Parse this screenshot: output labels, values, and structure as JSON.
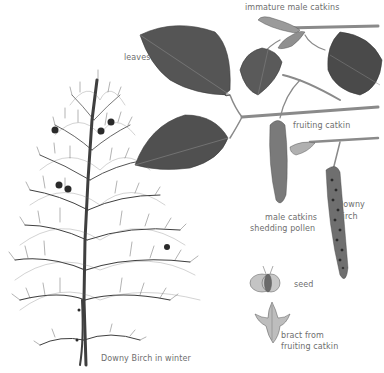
{
  "illustration": {
    "subject": "Downy Birch",
    "palette": {
      "background": "#ffffff",
      "ink": "#3a3a3a",
      "leaf_dark": "#4a4a4a",
      "leaf_mid": "#6a6a6a",
      "twig": "#8a8a8a",
      "label_text": "#6e6e6e"
    }
  },
  "labels": {
    "immature_male_catkins": "immature male catkins",
    "leaves": "leaves",
    "fruiting_catkin": "fruiting catkin",
    "downy_birch_line1": "Downy",
    "downy_birch_line2": "Birch",
    "male_catkins_line1": "male catkins",
    "male_catkins_line2": "shedding pollen",
    "seed": "seed",
    "bract_line1": "bract from",
    "bract_line2": "fruiting catkin",
    "tree_caption": "Downy Birch in winter"
  }
}
